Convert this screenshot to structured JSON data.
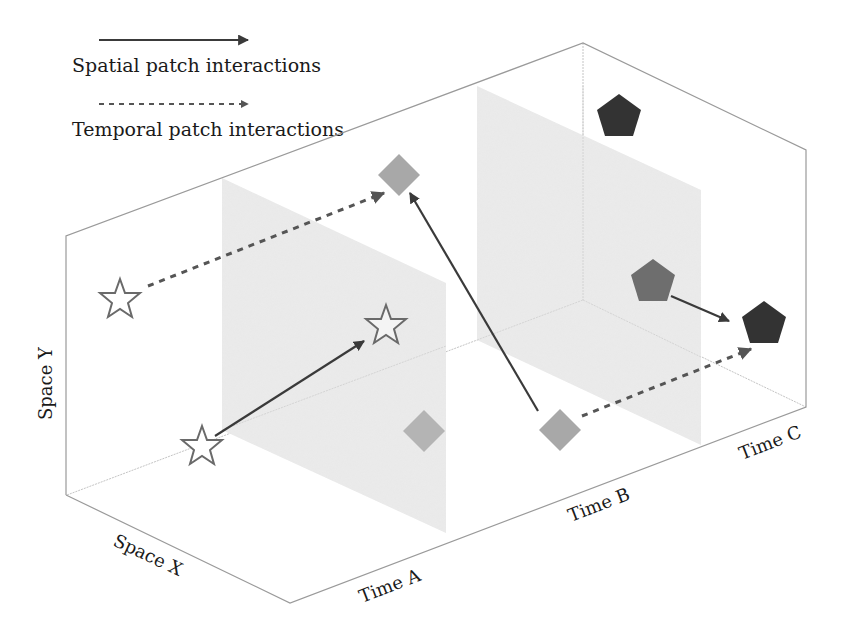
{
  "legend": {
    "spatial": {
      "label": "Spatial patch interactions",
      "style": "solid"
    },
    "temporal": {
      "label": "Temporal patch interactions",
      "style": "dashed"
    }
  },
  "axes": {
    "space_y": "Space Y",
    "space_x": "Space X",
    "time_a": "Time A",
    "time_b": "Time B",
    "time_c": "Time C"
  },
  "colors": {
    "box_edge": "#9a9a9a",
    "panel_fill": "#ececec",
    "arrow": "#3a3a3a",
    "star_stroke": "#6a6a6a",
    "diamond_fill": "#a8a8a8",
    "pentagon_light": "#6e6e6e",
    "pentagon_dark": "#333333"
  },
  "patches": [
    {
      "shape": "star",
      "time": "A",
      "role": "source",
      "x": 120,
      "y": 300
    },
    {
      "shape": "star",
      "time": "A",
      "role": "source",
      "x": 202,
      "y": 447
    },
    {
      "shape": "star",
      "time": "A",
      "role": "target",
      "x": 386,
      "y": 326
    },
    {
      "shape": "diamond",
      "time": "B",
      "role": "target",
      "x": 399,
      "y": 175
    },
    {
      "shape": "diamond",
      "time": "A",
      "role": "static",
      "x": 424,
      "y": 431
    },
    {
      "shape": "diamond",
      "time": "B",
      "role": "source",
      "x": 560,
      "y": 430
    },
    {
      "shape": "pentagon",
      "time": "C",
      "role": "static",
      "x": 619,
      "y": 116
    },
    {
      "shape": "pentagon",
      "time": "C",
      "role": "source",
      "x": 653,
      "y": 281
    },
    {
      "shape": "pentagon",
      "time": "C",
      "role": "target",
      "x": 764,
      "y": 323
    }
  ],
  "interactions": [
    {
      "type": "temporal",
      "from": "star (Time A, back)",
      "to": "diamond (Time B, top)"
    },
    {
      "type": "spatial",
      "from": "star (Time A, front)",
      "to": "star (Time A, middle)"
    },
    {
      "type": "spatial",
      "from": "diamond (Time B, bottom)",
      "to": "diamond (Time B, top)"
    },
    {
      "type": "temporal",
      "from": "diamond (Time B, bottom)",
      "to": "pentagon (Time C, front)"
    },
    {
      "type": "spatial",
      "from": "pentagon (Time C, middle)",
      "to": "pentagon (Time C, front)"
    }
  ]
}
